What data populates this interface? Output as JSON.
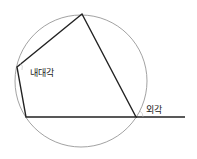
{
  "diagram": {
    "labels": {
      "interior_angle": "내대각",
      "exterior_angle": "외각"
    },
    "circle": {
      "cx": 81,
      "cy": 81,
      "r": 66,
      "stroke": "#8a8a8a"
    },
    "quadrilateral": {
      "vertices": [
        [
          82,
          14
        ],
        [
          17,
          67
        ],
        [
          26,
          117
        ],
        [
          136,
          117
        ]
      ],
      "stroke": "#222222"
    },
    "extension_line": {
      "from": [
        136,
        117
      ],
      "to": [
        185,
        117
      ]
    }
  }
}
